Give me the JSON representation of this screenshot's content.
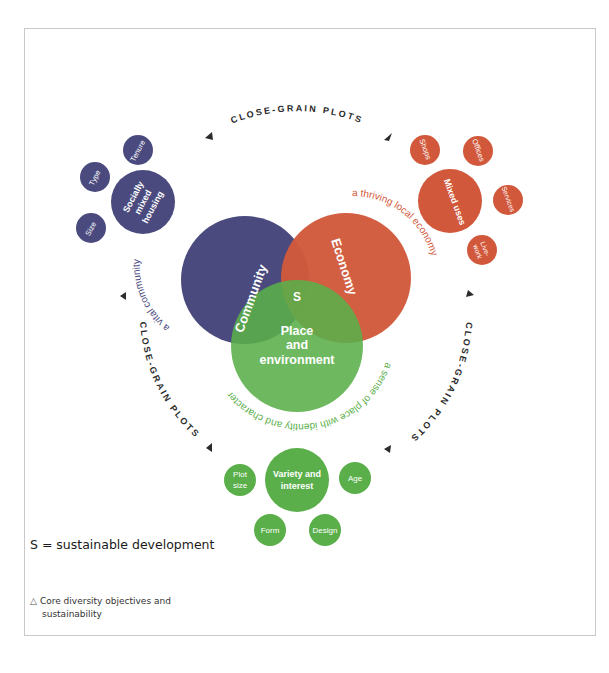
{
  "diagram": {
    "colors": {
      "community": "#4a4a7e",
      "economy": "#d1583a",
      "place": "#5aaf4a",
      "ring_text": "#2b2b2b",
      "border": "#c8c8c8"
    },
    "ring_label": "CLOSE-GRAIN PLOTS",
    "ring_labels": [
      {
        "position": "top",
        "text": "CLOSE-GRAIN PLOTS"
      },
      {
        "position": "left",
        "text": "CLOSE-GRAIN PLOTS"
      },
      {
        "position": "right",
        "text": "CLOSE-GRAIN PLOTS"
      }
    ],
    "core_circles": {
      "community": {
        "label": "Community",
        "tagline": "a vital community"
      },
      "economy": {
        "label": "Economy",
        "tagline": "a thriving local economy"
      },
      "place": {
        "label_line1": "Place",
        "label_line2": "and",
        "label_line3": "environment",
        "tagline": "a sense of place with identity and character"
      },
      "center": "S"
    },
    "clusters": {
      "housing": {
        "main_line1": "Socially",
        "main_line2": "mixed",
        "main_line3": "housing",
        "satellites": [
          "Tenure",
          "Type",
          "Size"
        ]
      },
      "mixed_uses": {
        "main": "Mixed uses",
        "satellites": [
          "Shops",
          "Offices",
          "Services",
          "Live-",
          "work"
        ]
      },
      "variety": {
        "main_line1": "Variety and",
        "main_line2": "interest",
        "satellites": [
          "Plot",
          "size",
          "Age",
          "Form",
          "Design"
        ]
      }
    }
  },
  "legend": {
    "text": "S = sustainable development"
  },
  "caption": {
    "marker": "△",
    "line1": "Core diversity objectives and",
    "line2": "sustainability"
  }
}
